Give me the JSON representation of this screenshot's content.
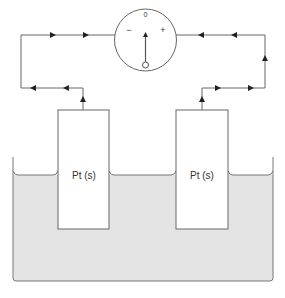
{
  "diagram": {
    "type": "electrochemical-cell",
    "meter": {
      "negative_label": "−",
      "positive_label": "+",
      "zero_label": "0"
    },
    "electrodes": [
      {
        "label": "Pt (s)",
        "side": "left"
      },
      {
        "label": "Pt (s)",
        "side": "right"
      }
    ],
    "colors": {
      "line": "#555555",
      "arrow": "#222222",
      "solution": "#e4e4e4",
      "electrode_fill": "#ffffff"
    }
  }
}
